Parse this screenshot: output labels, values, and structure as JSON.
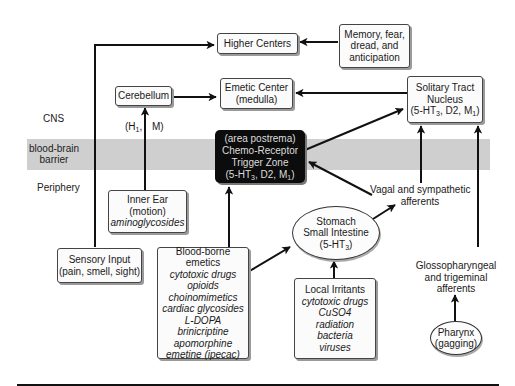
{
  "diagram": {
    "zones": {
      "cns": "CNS",
      "bbb_line1": "blood-brain",
      "bbb_line2": "barrier",
      "periphery": "Periphery"
    },
    "nodes": {
      "higher_centers": {
        "label": "Higher Centers"
      },
      "memory": {
        "line1": "Memory, fear,",
        "line2": "dread, and",
        "line3": "anticipation"
      },
      "cerebellum": {
        "label": "Cerebellum"
      },
      "emetic_center": {
        "line1": "Emetic Center",
        "line2": "(medulla)"
      },
      "solitary_tract": {
        "line1": "Solitary Tract",
        "line2": "Nucleus",
        "line3_pre": "(5-HT",
        "line3_sub1": "3",
        "line3_mid": ", D2, M",
        "line3_sub2": "1",
        "line3_post": ")"
      },
      "ctz": {
        "line1": "(area postrema)",
        "line2": "Chemo-Receptor",
        "line3": "Trigger Zone",
        "line4_pre": "(5-HT",
        "line4_sub1": "3",
        "line4_mid": ", D2, M",
        "line4_sub2": "1",
        "line4_post": ")"
      },
      "receptor_label": {
        "h_pre": "(H",
        "h_sub": "1",
        "h_post": ",",
        "m": "M)"
      },
      "inner_ear": {
        "line1": "Inner Ear",
        "line2": "(motion)",
        "line3": "aminoglycosides"
      },
      "vagal": {
        "line1": "Vagal and sympathetic",
        "line2": "afferents"
      },
      "stomach": {
        "line1": "Stomach",
        "line2": "Small Intestine",
        "line3_pre": "(5-HT",
        "line3_sub": "3",
        "line3_post": ")"
      },
      "sensory_input": {
        "line1": "Sensory Input",
        "line2": "(pain, smell, sight)"
      },
      "blood_borne": {
        "title": "Blood-borne emetics",
        "items": [
          "cytotoxic drugs",
          "opioids",
          "choinomimetics",
          "cardiac glycosides",
          "L-DOPA",
          "brinicriptine",
          "apomorphine",
          "emetine (ipecac)"
        ]
      },
      "local_irritants": {
        "title": "Local Irritants",
        "items": [
          "cytotoxic drugs",
          "CuSO4",
          "radiation",
          "bacteria",
          "viruses"
        ]
      },
      "glossopharyngeal": {
        "line1": "Glossopharyngeal",
        "line2": "and trigeminal",
        "line3": "afferents"
      },
      "pharynx": {
        "line1": "Pharynx",
        "line2": "(gagging)"
      }
    },
    "edges": [
      {
        "from": "Sensory Input",
        "to": "Higher Centers"
      },
      {
        "from": "Memory, fear, dread, and anticipation",
        "to": "Higher Centers"
      },
      {
        "from": "Cerebellum",
        "to": "Emetic Center"
      },
      {
        "from": "Solitary Tract Nucleus",
        "to": "Emetic Center"
      },
      {
        "from": "Inner Ear",
        "to": "Cerebellum",
        "label": "(H1, M)"
      },
      {
        "from": "Chemo-Receptor Trigger Zone",
        "to": "Solitary Tract Nucleus"
      },
      {
        "from": "Vagal and sympathetic afferents",
        "to": "Chemo-Receptor Trigger Zone"
      },
      {
        "from": "Vagal and sympathetic afferents",
        "to": "Solitary Tract Nucleus"
      },
      {
        "from": "Glossopharyngeal and trigeminal afferents",
        "to": "Solitary Tract Nucleus"
      },
      {
        "from": "Blood-borne emetics",
        "to": "Chemo-Receptor Trigger Zone"
      },
      {
        "from": "Blood-borne emetics",
        "to": "Stomach Small Intestine"
      },
      {
        "from": "Stomach Small Intestine",
        "to": "Vagal and sympathetic afferents"
      },
      {
        "from": "Local Irritants",
        "to": "Stomach Small Intestine"
      },
      {
        "from": "Pharynx",
        "to": "Glossopharyngeal and trigeminal afferents"
      }
    ],
    "colors": {
      "band": "#cfcfcf",
      "ctz_fill": "#0c0c0c",
      "ctz_text": "#dcdcdc",
      "lines": "#111111"
    }
  }
}
